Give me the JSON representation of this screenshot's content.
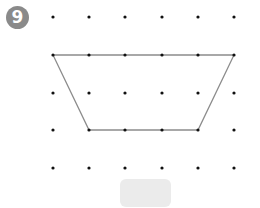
{
  "problem": {
    "number": "9",
    "badge_color": "#8a8a8a"
  },
  "grid": {
    "columns_x": [
      53,
      89,
      125,
      162,
      198,
      234
    ],
    "rows_y": [
      17,
      55,
      93,
      130,
      168
    ],
    "dot_color": "#111111",
    "dot_radius": 1.6
  },
  "shape": {
    "type": "trapezoid",
    "stroke_color": "#8c8c8c",
    "vertices": [
      [
        53,
        55
      ],
      [
        234,
        55
      ],
      [
        198,
        130
      ],
      [
        89,
        130
      ]
    ]
  },
  "answer_box": {
    "value": "",
    "color": "#ebebeb"
  }
}
